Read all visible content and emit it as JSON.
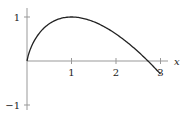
{
  "chart_data": {
    "type": "line",
    "title": "",
    "xlabel": "x",
    "ylabel": "",
    "function": "y = x(1 - ln x)",
    "xlim": [
      0,
      3
    ],
    "ylim": [
      -1,
      1
    ],
    "x_ticks": [
      "1",
      "2",
      "3"
    ],
    "y_ticks": [
      "1",
      "-1"
    ],
    "y_tick_labels": [
      "1",
      "−1"
    ],
    "series": [
      {
        "name": "curve",
        "x": [
          0,
          0.25,
          0.5,
          0.75,
          1,
          1.5,
          2,
          2.5,
          2.718,
          3
        ],
        "y": [
          0,
          0.6,
          0.85,
          0.97,
          1,
          0.89,
          0.61,
          0.21,
          0,
          -0.3
        ]
      }
    ],
    "grid": false,
    "legend": null
  }
}
